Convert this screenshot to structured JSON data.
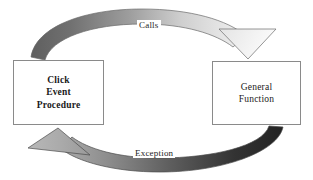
{
  "diagram": {
    "background_color": "#ffffff",
    "nodes": [
      {
        "id": "click-event-procedure",
        "lines": [
          "Click",
          "Event",
          "Procedure"
        ],
        "bold": true,
        "border_color": "#8a8a8a",
        "fill_color": "#ffffff"
      },
      {
        "id": "general-function",
        "lines": [
          "General",
          "Function"
        ],
        "bold": false,
        "border_color": "#8a8a8a",
        "fill_color": "#ffffff"
      }
    ],
    "edges": [
      {
        "id": "calls",
        "label": "Calls",
        "from": "click-event-procedure",
        "to": "general-function",
        "direction": "top-clockwise",
        "arrowhead": "down",
        "gradient_from": "#6e6e6e",
        "gradient_to": "#efefef",
        "outline_color": "#545454"
      },
      {
        "id": "exception",
        "label": "Exception",
        "from": "general-function",
        "to": "click-event-procedure",
        "direction": "bottom-clockwise",
        "arrowhead": "up-left",
        "gradient_from": "#2b2b2b",
        "gradient_to": "#a8a8a8",
        "outline_color": "#4a4a4a"
      }
    ]
  }
}
